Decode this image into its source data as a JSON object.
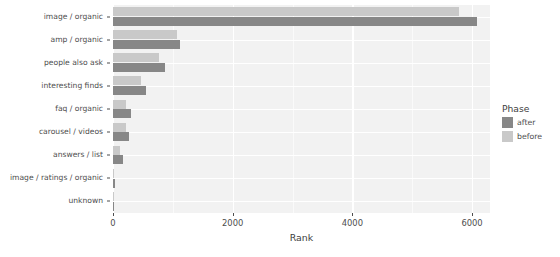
{
  "chart_data": {
    "type": "bar",
    "orientation": "horizontal",
    "grouped": true,
    "title": "",
    "xlabel": "Rank",
    "ylabel": "",
    "xlim": [
      0,
      6300
    ],
    "xticks": [
      0,
      2000,
      4000,
      6000
    ],
    "xticklabels": [
      "0",
      "2000",
      "4000",
      "6000"
    ],
    "grid": true,
    "legend": {
      "title": "Phase",
      "position": "right",
      "entries": [
        {
          "label": "after",
          "color": "#878787"
        },
        {
          "label": "before",
          "color": "#c9c9c9"
        }
      ]
    },
    "categories": [
      "image / organic",
      "amp / organic",
      "people also ask",
      "interesting finds",
      "faq / organic",
      "carousel / videos",
      "answers / list",
      "image / ratings / organic",
      "unknown"
    ],
    "series": [
      {
        "name": "before",
        "color": "#c9c9c9",
        "values": [
          5790,
          1070,
          770,
          470,
          215,
          215,
          125,
          25,
          5
        ]
      },
      {
        "name": "after",
        "color": "#878787",
        "values": [
          6085,
          1120,
          870,
          550,
          300,
          270,
          160,
          40,
          5
        ]
      }
    ]
  },
  "axis": {
    "x_title": "Rank"
  }
}
